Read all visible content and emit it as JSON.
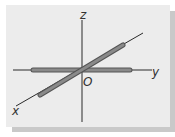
{
  "diagram": {
    "type": "3d-coordinate-axes",
    "labels": {
      "x": "x",
      "y": "y",
      "z": "z",
      "origin": "O"
    },
    "colors": {
      "panel": "#ececec",
      "shadow": "#c9c9c9",
      "axis_line": "#2a2a2a",
      "rod_fill": "#8a8a8a",
      "rod_outline": "#555555",
      "label": "#333333"
    },
    "elements": [
      {
        "name": "z-axis",
        "description": "vertical thin line through origin"
      },
      {
        "name": "y-axis",
        "description": "horizontal line with thick gray rod segment"
      },
      {
        "name": "x-axis",
        "description": "diagonal line with thick gray rod segment"
      }
    ]
  }
}
